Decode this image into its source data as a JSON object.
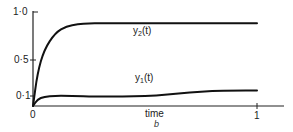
{
  "chart_data": {
    "type": "line",
    "title": "",
    "caption": "b",
    "xlabel": "time",
    "ylabel": "",
    "xlim": [
      0,
      1
    ],
    "ylim": [
      0,
      1.0
    ],
    "x_ticks": [
      "0",
      "1"
    ],
    "y_ticks": [
      "0·1",
      "0·5",
      "1·0"
    ],
    "grid": false,
    "legend": "inline labels",
    "x": [
      0,
      0.02,
      0.05,
      0.1,
      0.15,
      0.2,
      0.25,
      0.3,
      0.4,
      0.5,
      0.6,
      0.7,
      0.8,
      0.9,
      1.0
    ],
    "series": [
      {
        "name": "y2(t)",
        "label_main": "y",
        "label_sub": "2",
        "label_suffix": "(t)",
        "values": [
          0,
          0.35,
          0.6,
          0.78,
          0.85,
          0.87,
          0.88,
          0.88,
          0.88,
          0.88,
          0.88,
          0.88,
          0.88,
          0.88,
          0.88
        ]
      },
      {
        "name": "y1(t)",
        "label_main": "y",
        "label_sub": "1",
        "label_suffix": "(t)",
        "values": [
          0,
          0.07,
          0.1,
          0.11,
          0.11,
          0.105,
          0.1,
          0.1,
          0.1,
          0.105,
          0.12,
          0.145,
          0.16,
          0.165,
          0.165
        ]
      }
    ]
  }
}
